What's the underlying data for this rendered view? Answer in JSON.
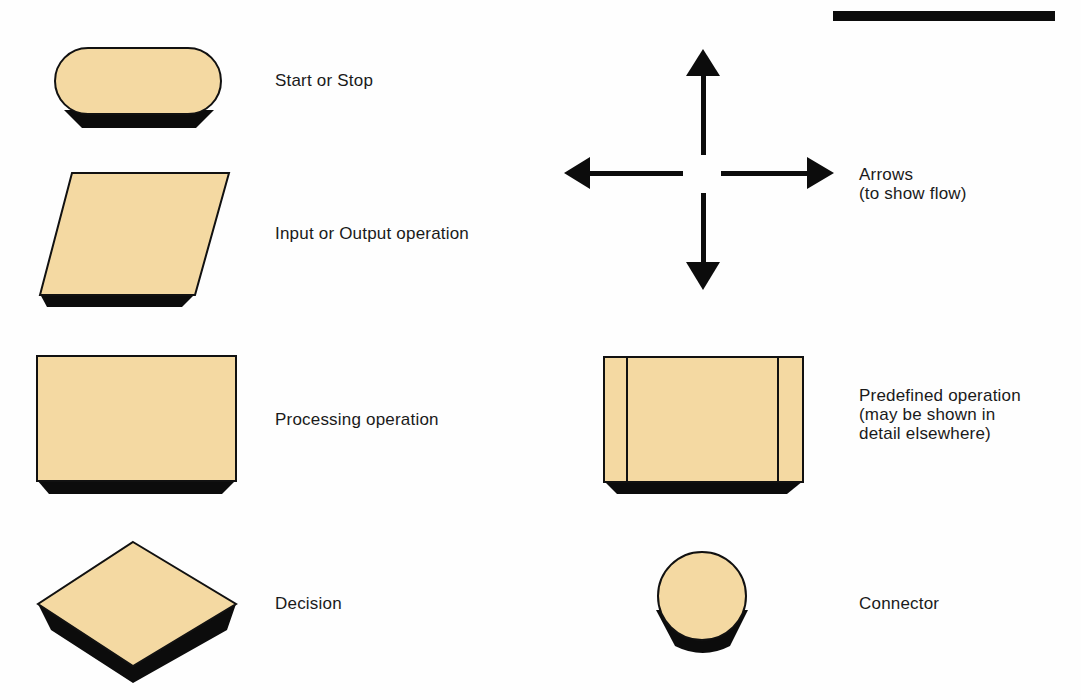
{
  "colors": {
    "fill": "#f4d9a2",
    "outline": "#111111",
    "shadow": "#0c0c0c",
    "background": "#fefefe"
  },
  "legend": {
    "items": [
      {
        "symbol": "terminator",
        "icon": "start-stop-icon",
        "label": "Start or Stop"
      },
      {
        "symbol": "parallelogram",
        "icon": "input-output-icon",
        "label": "Input or Output operation"
      },
      {
        "symbol": "rectangle",
        "icon": "processing-icon",
        "label": "Processing operation"
      },
      {
        "symbol": "diamond",
        "icon": "decision-icon",
        "label": "Decision"
      },
      {
        "symbol": "arrows",
        "icon": "arrows-icon",
        "label": "Arrows\n(to show flow)"
      },
      {
        "symbol": "predefined-process",
        "icon": "predefined-operation-icon",
        "label": "Predefined operation\n(may be shown in\ndetail elsewhere)"
      },
      {
        "symbol": "circle",
        "icon": "connector-icon",
        "label": "Connector"
      }
    ]
  }
}
